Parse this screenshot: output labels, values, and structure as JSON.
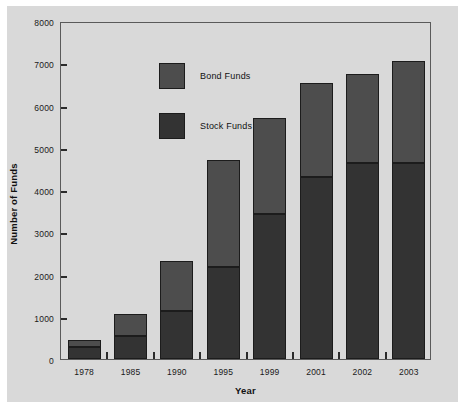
{
  "chart_data": {
    "type": "bar",
    "subtype": "stacked-vertical",
    "title": "",
    "xlabel": "Year",
    "ylabel": "Number of Funds",
    "categories": [
      "1978",
      "1985",
      "1990",
      "1995",
      "1999",
      "2001",
      "2002",
      "2003"
    ],
    "series": [
      {
        "name": "Stock Funds",
        "color": "#333333",
        "values": [
          285,
          545,
          1135,
          2180,
          3430,
          4305,
          4640,
          4640
        ]
      },
      {
        "name": "Bond Funds",
        "color": "#4d4d4d",
        "values": [
          165,
          520,
          1185,
          2530,
          2275,
          2225,
          2105,
          2415
        ]
      }
    ],
    "totals": [
      450,
      1065,
      2320,
      4710,
      5705,
      6530,
      6745,
      7055
    ],
    "ylim": [
      0,
      8000
    ],
    "yticks": [
      0,
      1000,
      2000,
      3000,
      4000,
      5000,
      6000,
      7000,
      8000
    ],
    "ytick_labels": [
      "0",
      "1000",
      "2000",
      "3000",
      "4000",
      "5000",
      "6000",
      "7000",
      "8000"
    ],
    "grid": false,
    "legend_position": "upper-left-inside",
    "legend_entries": [
      "Bond Funds",
      "Stock Funds"
    ]
  },
  "legend": {
    "entries": [
      {
        "label": "Bond Funds",
        "color": "#4d4d4d"
      },
      {
        "label": "Stock Funds",
        "color": "#333333"
      }
    ]
  },
  "axes": {
    "x_title": "Year",
    "y_title": "Number of Funds"
  },
  "colors": {
    "figure_background": "#d9d9d9",
    "page_background": "#ffffff",
    "axis_line": "#5a5a5a",
    "text": "#111111",
    "bond_funds": "#4d4d4d",
    "stock_funds": "#333333",
    "bar_outline": "#1c1c1c"
  }
}
